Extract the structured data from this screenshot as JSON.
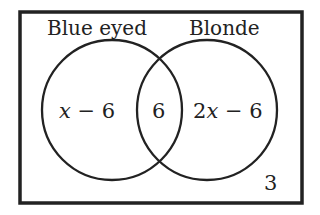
{
  "diagram": {
    "type": "venn",
    "sets": [
      {
        "label": "Blue eyed"
      },
      {
        "label": "Blonde"
      }
    ],
    "regions": {
      "blue_only": {
        "prefix": "",
        "var": "x",
        "suffix": " − 6"
      },
      "both": "6",
      "blonde_only": {
        "prefix": "2",
        "var": "x",
        "suffix": " − 6"
      },
      "neither": "3"
    },
    "colors": {
      "stroke": "#222222",
      "background": "#ffffff"
    }
  }
}
